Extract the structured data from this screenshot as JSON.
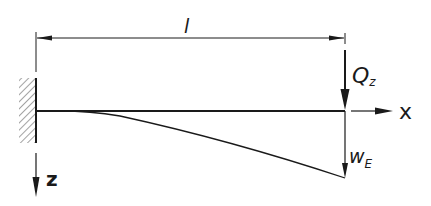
{
  "diagram": {
    "type": "cantilever-beam",
    "colors": {
      "line": "#1a1a1a",
      "hatch": "#555555",
      "background": "#ffffff"
    },
    "labels": {
      "length": "l",
      "force": "Q",
      "force_subscript": "z",
      "x_axis": "x",
      "z_axis": "z",
      "end_deflection": "w",
      "end_deflection_subscript": "E"
    },
    "elements": {
      "support": "fixed-wall",
      "load": "point-force-at-free-end",
      "deflection_curve": "bending-line"
    }
  }
}
